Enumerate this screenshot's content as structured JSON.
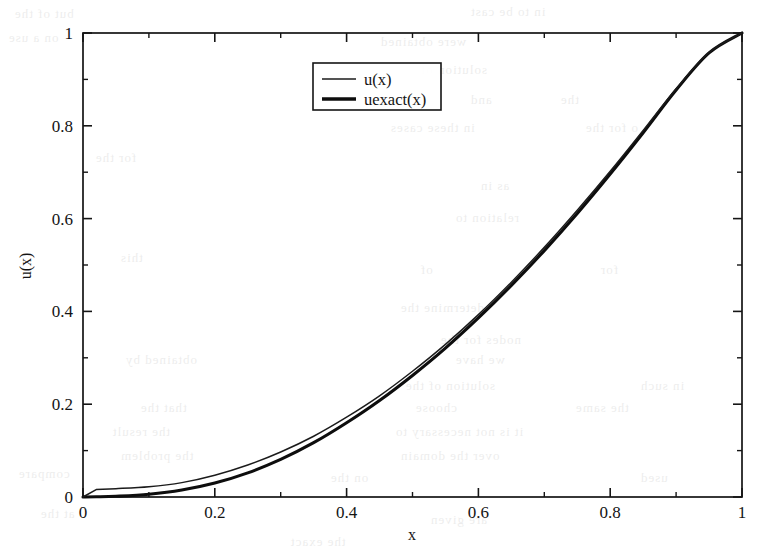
{
  "figure": {
    "kind": "line-plot",
    "background_color": "#ffffff",
    "ink_color": "#141414"
  },
  "axes": {
    "x_title": "x",
    "y_title": "u(x)",
    "x_ticks": [
      "0",
      "0.2",
      "0.4",
      "0.6",
      "0.8",
      "1"
    ],
    "y_ticks": [
      "0",
      "0.2",
      "0.4",
      "0.6",
      "0.8",
      "1"
    ],
    "x_tick_values": [
      0,
      0.2,
      0.4,
      0.6,
      0.8,
      1
    ],
    "y_tick_values": [
      0,
      0.2,
      0.4,
      0.6,
      0.8,
      1
    ],
    "x_minor_values": [
      0.1,
      0.3,
      0.5,
      0.7,
      0.9
    ],
    "y_minor_values": [
      0.1,
      0.3,
      0.5,
      0.7,
      0.9
    ]
  },
  "legend": {
    "position": "top-center",
    "entries": [
      {
        "label": "u(x)",
        "style": "thin-line",
        "color": "#1b1b1b"
      },
      {
        "label": "uexact(x)",
        "style": "thick-line",
        "color": "#0d0d0d"
      }
    ]
  },
  "scan_artifacts": [
    {
      "text": "but of the",
      "x": 14,
      "y": 6,
      "size": 13
    },
    {
      "text": "in to be cast",
      "x": 470,
      "y": 4,
      "size": 13
    },
    {
      "text": "on a use",
      "x": 8,
      "y": 30,
      "size": 13
    },
    {
      "text": "were obtained",
      "x": 380,
      "y": 34,
      "size": 13
    },
    {
      "text": "solution of",
      "x": 420,
      "y": 62,
      "size": 13
    },
    {
      "text": "and",
      "x": 470,
      "y": 92,
      "size": 13
    },
    {
      "text": "the",
      "x": 560,
      "y": 92,
      "size": 13
    },
    {
      "text": "in these cases",
      "x": 390,
      "y": 120,
      "size": 13
    },
    {
      "text": "o for the",
      "x": 585,
      "y": 120,
      "size": 13
    },
    {
      "text": "for the",
      "x": 95,
      "y": 150,
      "size": 13
    },
    {
      "text": "as in",
      "x": 480,
      "y": 178,
      "size": 13
    },
    {
      "text": "relation to",
      "x": 455,
      "y": 210,
      "size": 13
    },
    {
      "text": "this",
      "x": 120,
      "y": 250,
      "size": 13
    },
    {
      "text": "of",
      "x": 420,
      "y": 262,
      "size": 13
    },
    {
      "text": "for",
      "x": 600,
      "y": 262,
      "size": 13
    },
    {
      "text": "determine the",
      "x": 400,
      "y": 300,
      "size": 13
    },
    {
      "text": "nodes for the",
      "x": 440,
      "y": 332,
      "size": 13
    },
    {
      "text": "obtained by",
      "x": 125,
      "y": 352,
      "size": 13
    },
    {
      "text": "we have",
      "x": 455,
      "y": 352,
      "size": 13
    },
    {
      "text": "solution of the",
      "x": 405,
      "y": 378,
      "size": 13
    },
    {
      "text": "in such",
      "x": 640,
      "y": 378,
      "size": 13
    },
    {
      "text": "that the",
      "x": 140,
      "y": 400,
      "size": 13
    },
    {
      "text": "choose",
      "x": 415,
      "y": 400,
      "size": 13
    },
    {
      "text": "the same",
      "x": 575,
      "y": 400,
      "size": 13
    },
    {
      "text": "the result",
      "x": 112,
      "y": 424,
      "size": 13
    },
    {
      "text": "it is not necessary to",
      "x": 395,
      "y": 424,
      "size": 13
    },
    {
      "text": "the problem",
      "x": 120,
      "y": 448,
      "size": 13
    },
    {
      "text": "over the domain",
      "x": 400,
      "y": 448,
      "size": 13
    },
    {
      "text": "compare",
      "x": 18,
      "y": 466,
      "size": 13
    },
    {
      "text": "on the",
      "x": 330,
      "y": 470,
      "size": 13
    },
    {
      "text": "used",
      "x": 640,
      "y": 470,
      "size": 13
    },
    {
      "text": "at the",
      "x": 40,
      "y": 506,
      "size": 13
    },
    {
      "text": "are given",
      "x": 430,
      "y": 512,
      "size": 13
    },
    {
      "text": "the exact",
      "x": 290,
      "y": 534,
      "size": 13
    }
  ],
  "chart_data": {
    "type": "line",
    "title": "",
    "xlabel": "x",
    "ylabel": "u(x)",
    "xlim": [
      0,
      1
    ],
    "ylim": [
      0,
      1
    ],
    "grid": false,
    "legend_position": "top-center",
    "x": [
      0,
      0.02,
      0.05,
      0.1,
      0.15,
      0.2,
      0.25,
      0.3,
      0.35,
      0.4,
      0.45,
      0.5,
      0.55,
      0.6,
      0.65,
      0.7,
      0.75,
      0.8,
      0.85,
      0.9,
      0.95,
      1
    ],
    "series": [
      {
        "name": "u(x)",
        "style": "thin-line",
        "color": "#1b1b1b",
        "values": [
          0,
          0.016,
          0.018,
          0.022,
          0.031,
          0.047,
          0.069,
          0.097,
          0.131,
          0.172,
          0.218,
          0.271,
          0.329,
          0.393,
          0.463,
          0.538,
          0.618,
          0.702,
          0.79,
          0.88,
          0.958,
          1.0
        ]
      },
      {
        "name": "uexact(x)",
        "style": "thick-line",
        "color": "#0d0d0d",
        "values": [
          0,
          0.0004,
          0.0016,
          0.006,
          0.015,
          0.03,
          0.052,
          0.081,
          0.117,
          0.16,
          0.208,
          0.262,
          0.321,
          0.386,
          0.456,
          0.531,
          0.611,
          0.696,
          0.785,
          0.877,
          0.957,
          1.0
        ]
      }
    ]
  }
}
